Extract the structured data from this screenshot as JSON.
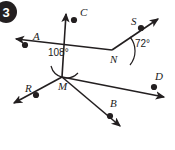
{
  "figure": {
    "badge": {
      "number": "3",
      "fill": "#231f20",
      "text_color": "#ffffff"
    },
    "stroke_color": "#231f20",
    "background": "#ffffff",
    "points": [
      {
        "id": "A",
        "label": "A",
        "x": 25,
        "y": 45,
        "label_x": 33,
        "label_y": 40
      },
      {
        "id": "C",
        "label": "C",
        "x": 74,
        "y": 20,
        "label_x": 80,
        "label_y": 16
      },
      {
        "id": "S",
        "label": "S",
        "x": 141,
        "y": 28,
        "label_x": 131,
        "label_y": 25
      },
      {
        "id": "D",
        "label": "D",
        "x": 154,
        "y": 87,
        "label_x": 155,
        "label_y": 80
      },
      {
        "id": "B",
        "label": "B",
        "x": 110,
        "y": 116,
        "label_x": 110,
        "label_y": 107
      },
      {
        "id": "R",
        "label": "R",
        "x": 36,
        "y": 95,
        "label_x": 25,
        "label_y": 92
      }
    ],
    "intersections": [
      {
        "id": "M",
        "label": "M",
        "x": 62,
        "y": 77,
        "label_x": 58,
        "label_y": 90
      },
      {
        "id": "N",
        "label": "N",
        "x": 112,
        "y": 50,
        "label_x": 110,
        "label_y": 63
      }
    ],
    "angles": [
      {
        "id": "angle-108",
        "value": "108°",
        "vertex": "M",
        "label_x": 60,
        "label_y": 56
      },
      {
        "id": "angle-72",
        "value": "72°",
        "vertex": "N",
        "label_x": 126,
        "label_y": 47
      }
    ],
    "lines": [
      {
        "id": "line-RC",
        "from": "R-arrow",
        "to": "C-arrow",
        "x1": 12,
        "y1": 105,
        "x2": 64,
        "y2": 11
      },
      {
        "id": "line-AD",
        "from": "A-arrow",
        "to": "D-arrow",
        "x1": 14,
        "y1": 37,
        "x2": 166,
        "y2": 99
      },
      {
        "id": "line-MB",
        "from": "M",
        "to": "B-arrow",
        "x1": 62,
        "y1": 77,
        "x2": 122,
        "y2": 128
      },
      {
        "id": "line-NS",
        "from": "N",
        "to": "S-arrow",
        "x1": 112,
        "y1": 50,
        "x2": 160,
        "y2": 17
      }
    ]
  }
}
